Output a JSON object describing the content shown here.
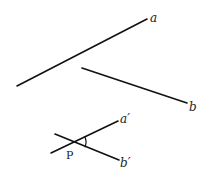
{
  "diagram": {
    "type": "geometry-parallel-lines-angle",
    "lines": [
      {
        "id": "a",
        "label": "a",
        "x1": 17,
        "y1": 86,
        "x2": 147,
        "y2": 19,
        "label_x": 150,
        "label_y": 22
      },
      {
        "id": "b",
        "label": "b",
        "x1": 82,
        "y1": 68,
        "x2": 187,
        "y2": 103,
        "label_x": 189,
        "label_y": 111
      },
      {
        "id": "a-prime",
        "label": "a′",
        "x1": 51,
        "y1": 153,
        "x2": 118,
        "y2": 121,
        "label_x": 120,
        "label_y": 123
      },
      {
        "id": "b-prime",
        "label": "b′",
        "x1": 55,
        "y1": 134,
        "x2": 119,
        "y2": 160,
        "label_x": 120,
        "label_y": 167
      }
    ],
    "point": {
      "label": "P",
      "x": 73,
      "y": 142,
      "label_x": 66,
      "label_y": 159
    },
    "angle_arc": {
      "cx": 73,
      "cy": 142,
      "r": 13
    }
  }
}
